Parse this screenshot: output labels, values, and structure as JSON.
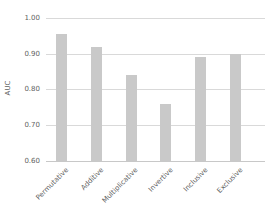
{
  "chart_data": {
    "type": "bar",
    "title": "",
    "categories": [
      "Permutative",
      "Additive",
      "Multiplicative",
      "Invertive",
      "Inclusive",
      "Exclusive"
    ],
    "values": [
      0.955,
      0.92,
      0.84,
      0.76,
      0.89,
      0.9
    ],
    "xlabel": "",
    "ylabel": "AUC",
    "ylim": [
      0.6,
      1.0
    ],
    "yticks": [
      0.6,
      0.7,
      0.8,
      0.9,
      1.0
    ],
    "ytick_labels": [
      "0.60",
      "0.70",
      "0.80",
      "0.90",
      "1.00"
    ],
    "grid": true,
    "legend_position": "none",
    "xtick_rotation_deg": 45,
    "colors": {
      "bar_fill": "#c9c9c9",
      "gridline": "#d9d9d9",
      "axis_line": "#c8c8c8",
      "text": "#5f5f5f",
      "background": "#ffffff"
    }
  }
}
